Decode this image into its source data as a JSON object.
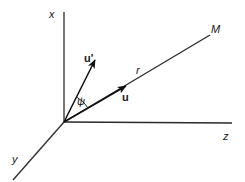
{
  "diagram": {
    "type": "3d-coordinate-vector-diagram",
    "colors": {
      "background": "#ffffff",
      "line": "#2a2a2a",
      "vector": "#111111"
    },
    "axes": {
      "x": {
        "label": "x"
      },
      "y": {
        "label": "y"
      },
      "z": {
        "label": "z"
      }
    },
    "ray": {
      "end_label": "M",
      "length_label": "r"
    },
    "vectors": {
      "u": {
        "label": "u"
      },
      "u_prime": {
        "label": "u'"
      }
    },
    "angle": {
      "label": "ψ"
    }
  }
}
